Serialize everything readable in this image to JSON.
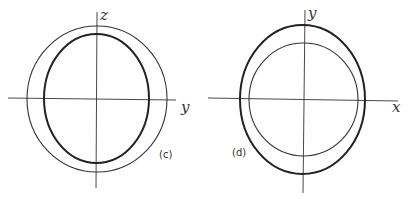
{
  "panels": [
    {
      "id": "c",
      "tag": "(c)",
      "vertical_axis_label": "z",
      "horizontal_axis_label": "y",
      "curves": [
        {
          "name": "outer-circle",
          "weight": "thin"
        },
        {
          "name": "inner-ellipse",
          "weight": "bold"
        }
      ]
    },
    {
      "id": "d",
      "tag": "(d)",
      "vertical_axis_label": "y",
      "horizontal_axis_label": "x",
      "curves": [
        {
          "name": "outer-ellipse",
          "weight": "bold"
        },
        {
          "name": "inner-circle",
          "weight": "thin"
        }
      ]
    }
  ]
}
